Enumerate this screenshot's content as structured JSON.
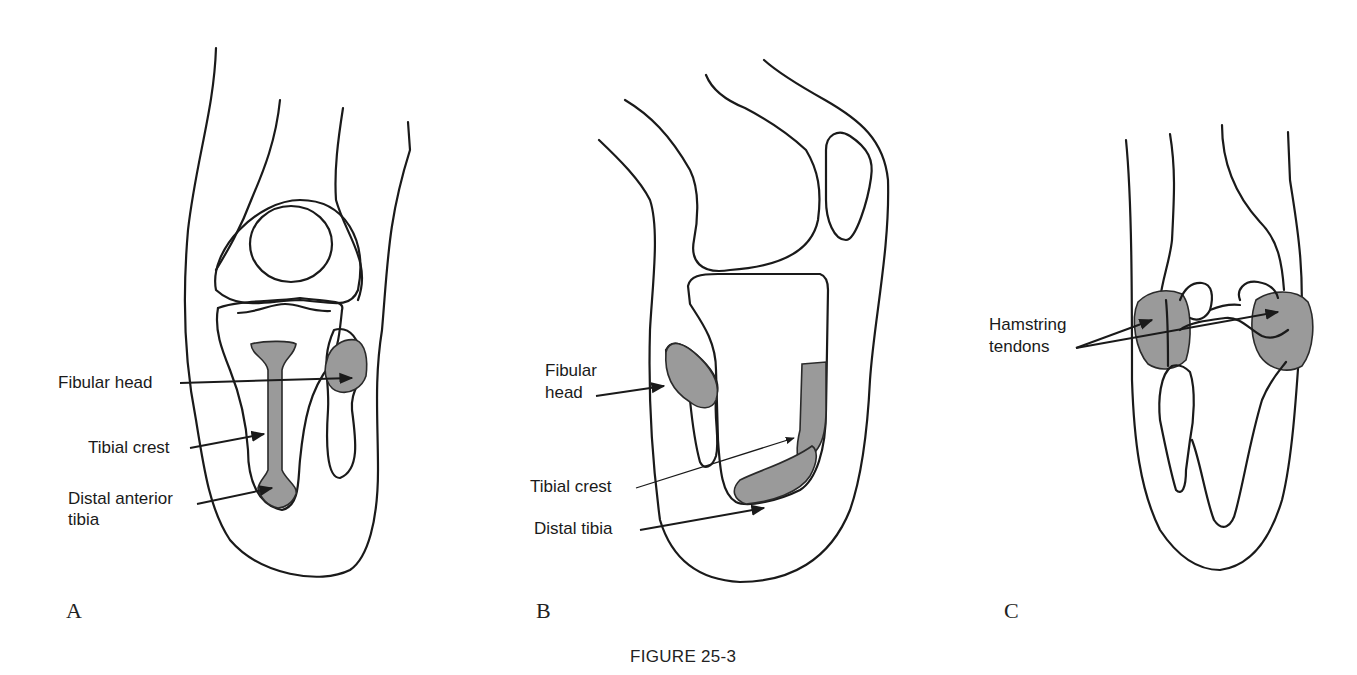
{
  "figure": {
    "caption": "FIGURE 25-3",
    "panels": [
      {
        "letter": "A",
        "view": "anterior knee",
        "labels": {
          "fibular_head": "Fibular head",
          "tibial_crest": "Tibial crest",
          "distal_anterior_tibia_line1": "Distal anterior",
          "distal_anterior_tibia_line2": "tibia"
        }
      },
      {
        "letter": "B",
        "view": "lateral knee (flexed)",
        "labels": {
          "fibular_head_line1": "Fibular",
          "fibular_head_line2": "head",
          "tibial_crest": "Tibial crest",
          "distal_tibia": "Distal tibia"
        }
      },
      {
        "letter": "C",
        "view": "posterior knee",
        "labels": {
          "hamstring_line1": "Hamstring",
          "hamstring_line2": "tendons"
        }
      }
    ],
    "colors": {
      "line": "#1a1a1a",
      "shade": "#9a9a9a",
      "background": "#ffffff"
    }
  }
}
